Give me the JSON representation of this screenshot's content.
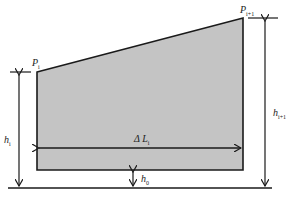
{
  "diagram": {
    "colors": {
      "fill": "#c4c4c4",
      "stroke": "#1a1a1a"
    },
    "labels": {
      "p_i": {
        "main": "P",
        "sub": "i"
      },
      "p_i1": {
        "main": "P",
        "sub": "i+1"
      },
      "h_i": {
        "main": "h",
        "sub": "i"
      },
      "h_i1": {
        "main": "h",
        "sub": "i+1"
      },
      "delta_l": {
        "main": "Δ L",
        "sub": "i"
      },
      "h_0": {
        "main": "h",
        "sub": "0"
      }
    }
  }
}
